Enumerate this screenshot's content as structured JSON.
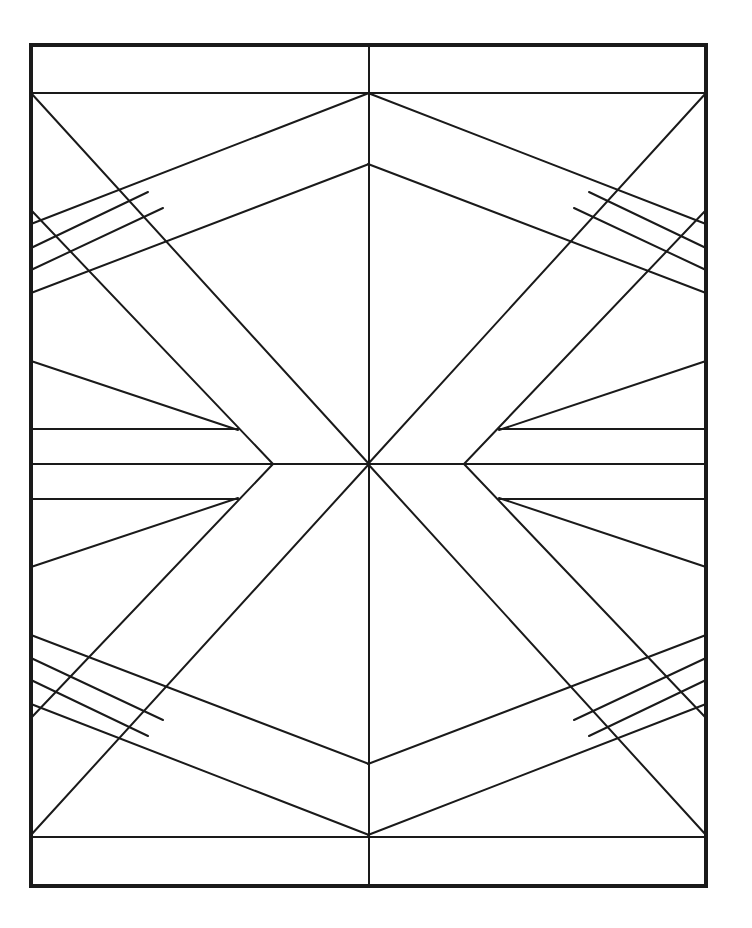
{
  "figure": {
    "stroke_color": "#1a1a1a",
    "background_color": "#ffffff",
    "frame": {
      "x1": 31,
      "y1": 45,
      "x2": 706,
      "y2": 886
    },
    "center": {
      "x": 369,
      "y": 464
    },
    "elements": [
      {
        "name": "top-band-line",
        "x1": 31,
        "y1": 93,
        "x2": 706,
        "y2": 93
      },
      {
        "name": "bottom-band-line",
        "x1": 31,
        "y1": 837,
        "x2": 706,
        "y2": 837
      },
      {
        "name": "vertical-center-line",
        "x1": 369,
        "y1": 45,
        "x2": 369,
        "y2": 886
      },
      {
        "name": "horizontal-center-line",
        "x1": 31,
        "y1": 464,
        "x2": 706,
        "y2": 464
      }
    ]
  }
}
